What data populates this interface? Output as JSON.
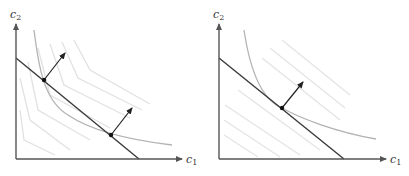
{
  "figure": {
    "panels": [
      {
        "id": "left",
        "x_label": "c",
        "x_label_sub": "1",
        "y_label": "c",
        "y_label_sub": "2",
        "description": "Kinked (piecewise-linear) contour lines with two tangency points on budget line"
      },
      {
        "id": "right",
        "x_label": "c",
        "x_label_sub": "1",
        "y_label": "c",
        "y_label_sub": "2",
        "description": "Parallel straight contour lines with single tangency point on budget line"
      }
    ],
    "colors": {
      "axis": "#555555",
      "budget_line": "#3a3a3a",
      "indifference_curve": "#b0b0b0",
      "contour_lines": "#e4e4e4",
      "arrow": "#222222",
      "point": "#111111"
    }
  }
}
